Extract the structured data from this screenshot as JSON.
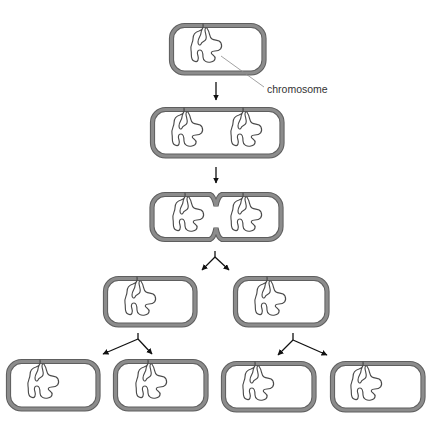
{
  "figure": {
    "type": "binary fission of a bacterial cell",
    "labels": {
      "chromosome": "chromosome"
    },
    "colors": {
      "cell_wall": "#8c8c8c",
      "cell_wall_edge": "#5e5e5e",
      "chromosome": "#4a4a4a",
      "arrow": "#111111",
      "background": "#ffffff"
    },
    "stages": [
      {
        "name": "parent-cell",
        "cells": 1,
        "chromosomes_per_cell": 1
      },
      {
        "name": "replicated-chromosome",
        "cells": 1,
        "chromosomes_per_cell": 2
      },
      {
        "name": "septum-forming",
        "cells": 1,
        "chromosomes_per_cell": 2
      },
      {
        "name": "first-generation-daughters",
        "cells": 2,
        "chromosomes_per_cell": 1
      },
      {
        "name": "second-generation-daughters",
        "cells": 4,
        "chromosomes_per_cell": 1
      }
    ]
  }
}
